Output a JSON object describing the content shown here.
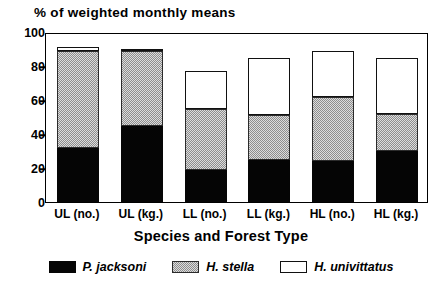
{
  "chart_data": {
    "type": "bar",
    "subtype": "stacked-bar",
    "title": "% of weighted monthly means",
    "xlabel": "Species and Forest Type",
    "ylabel": "% of weighted monthly means",
    "ylim": [
      0,
      100
    ],
    "yticks": [
      0,
      20,
      40,
      60,
      80,
      100
    ],
    "grid": false,
    "legend_position": "bottom",
    "categories": [
      "UL (no.)",
      "UL (kg.)",
      "LL (no.)",
      "LL (kg.)",
      "HL (no.)",
      "HL (kg.)"
    ],
    "series": [
      {
        "name": "P. jacksoni",
        "fill": "black",
        "color": "#050505",
        "values": [
          32,
          45,
          19,
          25,
          24,
          30
        ]
      },
      {
        "name": "H. stella",
        "fill": "gray-dither",
        "color": "#c9c9c9",
        "values": [
          57,
          44,
          36,
          26,
          38,
          22
        ]
      },
      {
        "name": "H. univittatus",
        "fill": "white",
        "color": "#ffffff",
        "values": [
          2,
          1,
          22,
          34,
          27,
          33
        ]
      }
    ],
    "cumulative_tops": {
      "P. jacksoni": [
        32,
        45,
        19,
        25,
        24,
        30
      ],
      "H. stella": [
        89,
        89,
        55,
        51,
        62,
        52
      ],
      "H. univittatus": [
        91,
        90,
        77,
        85,
        89,
        85
      ]
    }
  },
  "axis": {
    "y_ticks": [
      {
        "label": "100",
        "value": 100
      },
      {
        "label": "80",
        "value": 80
      },
      {
        "label": "60",
        "value": 60
      },
      {
        "label": "40",
        "value": 40
      },
      {
        "label": "20",
        "value": 20
      },
      {
        "label": "0",
        "value": 0
      }
    ],
    "x_title": "Species and Forest Type",
    "y_title": "% of weighted monthly means"
  },
  "legend": {
    "items": [
      {
        "label": "P. jacksoni",
        "swatch": "black-swatch"
      },
      {
        "label": "H. stella",
        "swatch": "gray-hatch-swatch"
      },
      {
        "label": "H. univittatus",
        "swatch": "white-swatch"
      }
    ]
  }
}
